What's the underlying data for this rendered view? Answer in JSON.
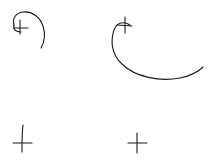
{
  "canvas": {
    "background": "#ffffff",
    "ink_color": "#1a1a1a"
  },
  "sketches": [
    {
      "name": "crosshair-with-spiral-top-left",
      "has_curve": true
    },
    {
      "name": "crosshair-with-arc-top-right",
      "has_curve": true
    },
    {
      "name": "crosshair-bottom-left",
      "has_curve": false
    },
    {
      "name": "crosshair-bottom-right",
      "has_curve": false
    }
  ]
}
